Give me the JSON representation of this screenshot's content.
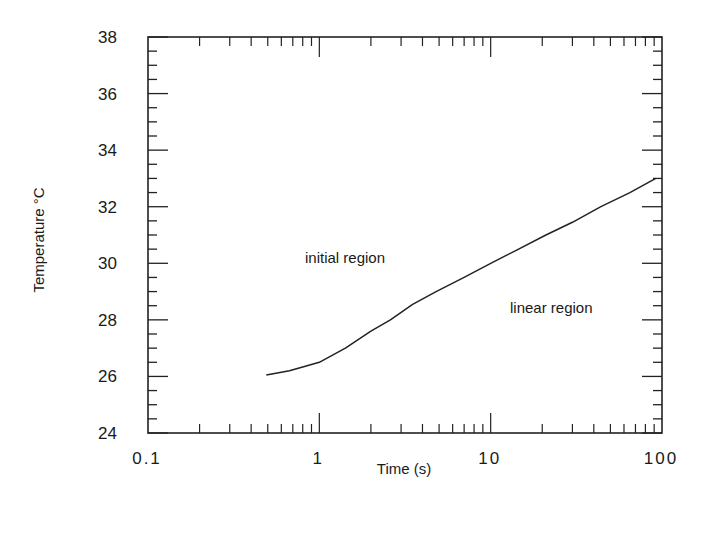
{
  "chart_data": {
    "type": "line",
    "title": "",
    "xlabel": "Time (s)",
    "ylabel": "Temperature °C",
    "xscale": "log",
    "xlim": [
      0.1,
      100
    ],
    "ylim": [
      24,
      38
    ],
    "grid": false,
    "legend": null,
    "x_ticks": [
      0.1,
      1,
      10,
      100
    ],
    "x_tick_labels": [
      "0.1",
      "1",
      "10",
      "100"
    ],
    "y_ticks": [
      24,
      26,
      28,
      30,
      32,
      34,
      36,
      38
    ],
    "y_tick_labels": [
      "24",
      "26",
      "28",
      "30",
      "32",
      "34",
      "36",
      "38"
    ],
    "series": [
      {
        "name": "temperature",
        "x": [
          0.49,
          0.67,
          1.0,
          1.42,
          2.0,
          2.6,
          3.5,
          4.8,
          7.0,
          10,
          14,
          21,
          30,
          44,
          65,
          92
        ],
        "y": [
          26.05,
          26.2,
          26.5,
          27.0,
          27.6,
          28.0,
          28.55,
          29.0,
          29.5,
          30.0,
          30.45,
          31.0,
          31.45,
          32.0,
          32.5,
          33.0
        ]
      }
    ],
    "annotations": [
      {
        "text": "initial region",
        "x": 1.9,
        "y": 30.15
      },
      {
        "text": "linear region",
        "x": 22,
        "y": 28.25
      }
    ]
  },
  "labels": {
    "xlabel": "Time (s)",
    "ylabel": "Temperature °C",
    "annot_initial": "initial region",
    "annot_linear": "linear region"
  },
  "style": {
    "line_color": "#222222",
    "axis_color": "#222222",
    "background": "#ffffff"
  }
}
